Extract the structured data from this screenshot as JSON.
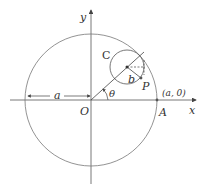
{
  "diagram": {
    "type": "geometry",
    "labels": {
      "y_axis": "y",
      "x_axis": "x",
      "origin": "O",
      "point_A": "A",
      "point_A_coords": "(a, 0)",
      "small_circle": "C",
      "point_P": "P",
      "radius_a": "a",
      "radius_b": "b",
      "angle": "θ"
    },
    "colors": {
      "stroke": "#555555",
      "text": "#333333",
      "background": "#ffffff"
    }
  }
}
